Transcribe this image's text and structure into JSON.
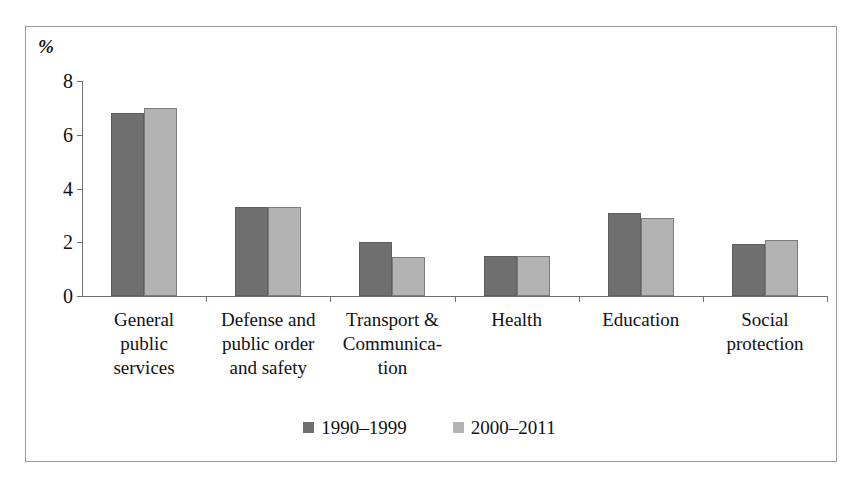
{
  "chart_data": {
    "type": "bar",
    "title": "",
    "subtitle": "",
    "xlabel": "",
    "ylabel": "%",
    "ylim": [
      0,
      8
    ],
    "yticks": [
      0,
      2,
      4,
      6,
      8
    ],
    "ytick_labels": [
      "0",
      "2",
      "4",
      "6",
      "8"
    ],
    "grid": false,
    "legend_position": "bottom-center",
    "categories": [
      "General public services",
      "Defense and public order and safety",
      "Transport & Communication",
      "Health",
      "Education",
      "Social protection"
    ],
    "category_label_lines": [
      [
        "General",
        "public",
        "services"
      ],
      [
        "Defense and",
        "public order",
        "and safety"
      ],
      [
        "Transport &",
        "Communica-",
        "tion"
      ],
      [
        "Health"
      ],
      [
        "Education"
      ],
      [
        "Social",
        "protection"
      ]
    ],
    "series": [
      {
        "name": "1990–1999",
        "color": "#6f6f6f",
        "values": [
          6.8,
          3.3,
          2.0,
          1.5,
          3.1,
          1.95
        ]
      },
      {
        "name": "2000–2011",
        "color": "#b3b3b3",
        "values": [
          7.0,
          3.3,
          1.45,
          1.5,
          2.9,
          2.1
        ]
      }
    ]
  },
  "axis": {
    "unit_label": "%"
  },
  "legend": {
    "items": [
      {
        "label": "1990–1999",
        "color": "#6f6f6f"
      },
      {
        "label": "2000–2011",
        "color": "#b3b3b3"
      }
    ]
  }
}
